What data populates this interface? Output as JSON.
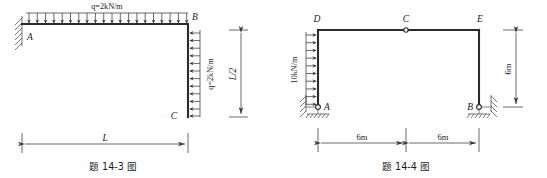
{
  "page": {
    "background_color": "#ffffff",
    "line_color": "#2b2b2b"
  },
  "figures": [
    {
      "id": "fig-14-3",
      "caption": "题 14-3 图",
      "nodes": [
        {
          "key": "A",
          "label": "A"
        },
        {
          "key": "B",
          "label": "B"
        },
        {
          "key": "C",
          "label": "C"
        }
      ],
      "loads": [
        {
          "key": "top-udl",
          "label": "q=2kN/m",
          "direction": "down",
          "arrow_count": 20,
          "orientation": "horizontal"
        },
        {
          "key": "right-udl",
          "label": "q=2kN/m",
          "direction": "left",
          "arrow_count": 12,
          "orientation": "vertical"
        }
      ],
      "supports": [
        {
          "key": "A",
          "type": "fixed",
          "label": "A"
        }
      ],
      "dimensions": [
        {
          "key": "span-L",
          "label": "L",
          "orientation": "horizontal"
        },
        {
          "key": "height-L2",
          "label": "L/2",
          "orientation": "vertical"
        }
      ]
    },
    {
      "id": "fig-14-4",
      "caption": "题 14-4 图",
      "nodes": [
        {
          "key": "D",
          "label": "D"
        },
        {
          "key": "C",
          "label": "C"
        },
        {
          "key": "E",
          "label": "E"
        },
        {
          "key": "A",
          "label": "A"
        },
        {
          "key": "B",
          "label": "B"
        }
      ],
      "loads": [
        {
          "key": "left-udl",
          "label": "10kN/m",
          "direction": "right",
          "arrow_count": 10,
          "orientation": "vertical"
        }
      ],
      "hinges": [
        {
          "key": "C",
          "label": "C",
          "type": "internal-hinge"
        }
      ],
      "supports": [
        {
          "key": "A",
          "type": "pinned-roller",
          "label": "A"
        },
        {
          "key": "B",
          "type": "pinned-roller",
          "label": "B"
        }
      ],
      "dimensions": [
        {
          "key": "span-left",
          "label": "6m",
          "orientation": "horizontal"
        },
        {
          "key": "span-right",
          "label": "6m",
          "orientation": "horizontal"
        },
        {
          "key": "height-right",
          "label": "6m",
          "orientation": "vertical"
        }
      ]
    }
  ]
}
